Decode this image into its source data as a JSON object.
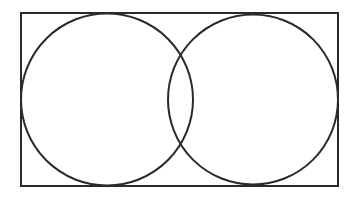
{
  "diagram": {
    "type": "venn",
    "stroke_color": "#2a2a2a",
    "background": "#ffffff",
    "frame": {
      "x": 21,
      "y": 13,
      "width": 317,
      "height": 173
    },
    "circles": [
      {
        "name": "left",
        "cx": 107,
        "cy": 99.5,
        "r": 86
      },
      {
        "name": "right",
        "cx": 253,
        "cy": 99.5,
        "r": 85
      }
    ]
  }
}
